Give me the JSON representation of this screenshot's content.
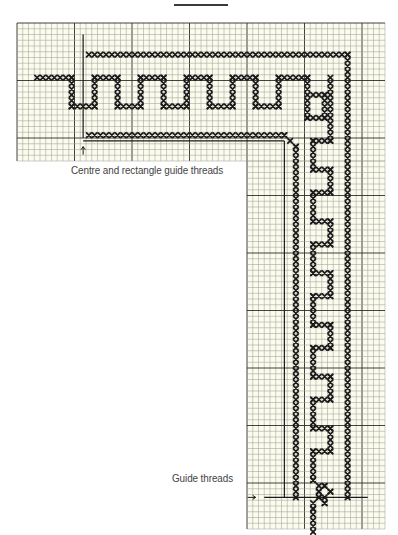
{
  "labels": {
    "centre_guide": "Centre and rectangle guide threads",
    "guide_threads": "Guide threads"
  },
  "colors": {
    "paper": "#fbfbee",
    "grid_minor": "#9a9a90",
    "grid_major": "#2e2e2e",
    "stitch": "#1a1a1a",
    "guide": "#1a1a1a"
  },
  "chart_data": {
    "type": "cross-stitch-chart",
    "cell_px": 5.75,
    "major_every": 10,
    "grid_regions": [
      {
        "name": "top-band",
        "col0": 0,
        "row0": 0,
        "cols": 64,
        "rows": 24
      },
      {
        "name": "right-column",
        "col0": 40,
        "row0": 24,
        "cols": 24,
        "rows": 64
      }
    ],
    "stitch_lines": [
      {
        "name": "outer-border-top",
        "from": [
          12,
          5
        ],
        "to": [
          57,
          5
        ]
      },
      {
        "name": "outer-border-right",
        "from": [
          57,
          5
        ],
        "to": [
          57,
          82
        ]
      },
      {
        "name": "inner-border-top",
        "from": [
          12,
          19
        ],
        "to": [
          46,
          19
        ]
      },
      {
        "name": "inner-border-diag",
        "from": [
          46,
          19
        ],
        "to": [
          48,
          21
        ]
      },
      {
        "name": "inner-border-right",
        "from": [
          48,
          21
        ],
        "to": [
          48,
          82
        ]
      },
      {
        "name": "meander-left-tail",
        "from": [
          3,
          9
        ],
        "to": [
          9,
          9
        ]
      },
      {
        "name": "meander-h",
        "extrapolated": true,
        "path": [
          [
            9,
            9
          ],
          [
            9,
            14
          ],
          [
            13,
            14
          ],
          [
            13,
            9
          ],
          [
            17,
            9
          ],
          [
            17,
            14
          ],
          [
            21,
            14
          ],
          [
            21,
            9
          ],
          [
            25,
            9
          ],
          [
            25,
            14
          ],
          [
            29,
            14
          ],
          [
            29,
            9
          ],
          [
            33,
            9
          ],
          [
            33,
            14
          ],
          [
            37,
            14
          ],
          [
            37,
            9
          ],
          [
            41,
            9
          ],
          [
            41,
            14
          ],
          [
            45,
            14
          ],
          [
            45,
            9
          ],
          [
            50,
            9
          ]
        ]
      },
      {
        "name": "corner-knot",
        "path": [
          [
            50,
            9
          ],
          [
            50,
            16
          ],
          [
            53,
            16
          ],
          [
            53,
            12
          ],
          [
            51,
            12
          ]
        ]
      },
      {
        "name": "corner-key-right",
        "path": [
          [
            54,
            9
          ],
          [
            54,
            20
          ],
          [
            51,
            20
          ],
          [
            51,
            25
          ],
          [
            54,
            25
          ],
          [
            54,
            29
          ],
          [
            51,
            29
          ]
        ]
      },
      {
        "name": "meander-v",
        "extrapolated": true,
        "path": [
          [
            51,
            29
          ],
          [
            51,
            34
          ],
          [
            54,
            34
          ],
          [
            54,
            38
          ],
          [
            51,
            38
          ],
          [
            51,
            43
          ],
          [
            54,
            43
          ],
          [
            54,
            47
          ],
          [
            51,
            47
          ],
          [
            51,
            52
          ],
          [
            54,
            52
          ],
          [
            54,
            56
          ],
          [
            51,
            56
          ],
          [
            51,
            61
          ],
          [
            54,
            61
          ],
          [
            54,
            65
          ],
          [
            51,
            65
          ],
          [
            51,
            70
          ],
          [
            54,
            70
          ],
          [
            54,
            74
          ],
          [
            51,
            74
          ],
          [
            51,
            79
          ]
        ]
      },
      {
        "name": "bottom-knot",
        "path": [
          [
            51,
            79
          ],
          [
            52,
            81
          ],
          [
            53,
            80
          ],
          [
            54,
            81
          ],
          [
            53,
            83
          ],
          [
            52,
            82
          ],
          [
            51,
            84
          ],
          [
            51,
            88
          ]
        ]
      }
    ],
    "guide_lines": [
      {
        "name": "centre-guide-vertical",
        "from": [
          11.5,
          2
        ],
        "to": [
          11.5,
          20
        ]
      },
      {
        "name": "rectangle-guide-top",
        "from": [
          11.5,
          20.5
        ],
        "to": [
          46.5,
          20.5
        ]
      },
      {
        "name": "rectangle-guide-left",
        "from": [
          46.5,
          20.5
        ],
        "to": [
          46.5,
          82.5
        ]
      },
      {
        "name": "guide-threads-horizontal",
        "from": [
          43,
          82.5
        ],
        "to": [
          61,
          82.5
        ]
      }
    ],
    "arrows": [
      {
        "name": "up-arrow",
        "at": [
          11.5,
          21.5
        ],
        "dir": "up"
      },
      {
        "name": "right-arrow",
        "at": [
          41.5,
          82.5
        ],
        "dir": "right"
      }
    ]
  }
}
